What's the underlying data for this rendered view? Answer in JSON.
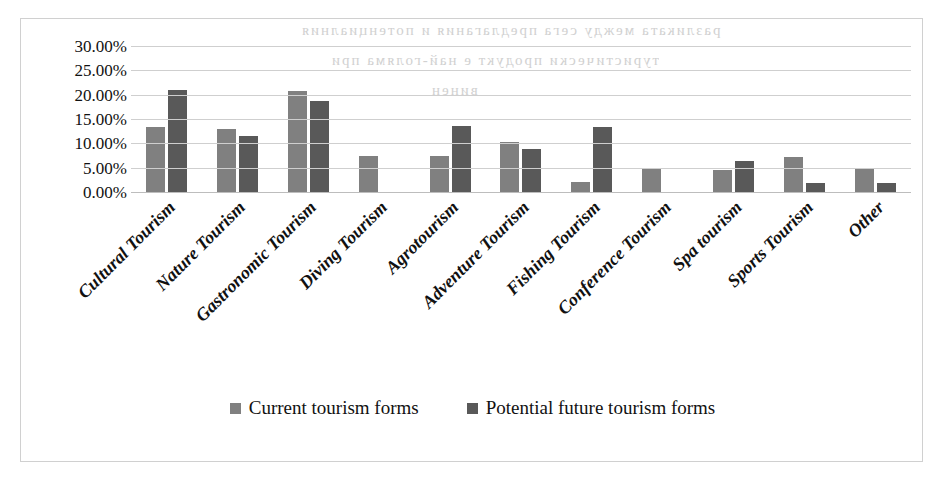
{
  "chart_data": {
    "type": "bar",
    "title": "",
    "xlabel": "",
    "ylabel": "",
    "ylim": [
      0,
      30
    ],
    "ytick_labels": [
      "30.00%",
      "25.00%",
      "20.00%",
      "15.00%",
      "10.00%",
      "5.00%",
      "0.00%"
    ],
    "ytick_values": [
      30,
      25,
      20,
      15,
      10,
      5,
      0
    ],
    "grid": true,
    "legend_position": "bottom",
    "categories": [
      "Cultural Tourism",
      "Nature Tourism",
      "Gastronomic Tourism",
      "Diving Tourism",
      "Agrotourism",
      "Adventure Tourism",
      "Fishing Tourism",
      "Conference Tourism",
      "Spa tourism",
      "Sports Tourism",
      "Other"
    ],
    "series": [
      {
        "name": "Current tourism forms",
        "color": "#808080",
        "values": [
          13.3,
          13.0,
          20.7,
          7.5,
          7.5,
          10.2,
          2.1,
          4.8,
          4.5,
          7.2,
          4.8
        ]
      },
      {
        "name": "Potential future tourism forms",
        "color": "#595959",
        "values": [
          20.9,
          11.6,
          18.6,
          0,
          13.6,
          8.9,
          13.4,
          0,
          6.3,
          1.9,
          1.8
        ]
      }
    ]
  },
  "legend": {
    "items": [
      {
        "label": "Current tourism forms",
        "color": "#808080"
      },
      {
        "label": "Potential future tourism forms",
        "color": "#595959"
      }
    ]
  },
  "scan_artifacts": {
    "bleed_lines": [
      "разликата между сега предлагания и потенциалния",
      "туристически продукт е най-голяма при",
      "винен"
    ]
  }
}
